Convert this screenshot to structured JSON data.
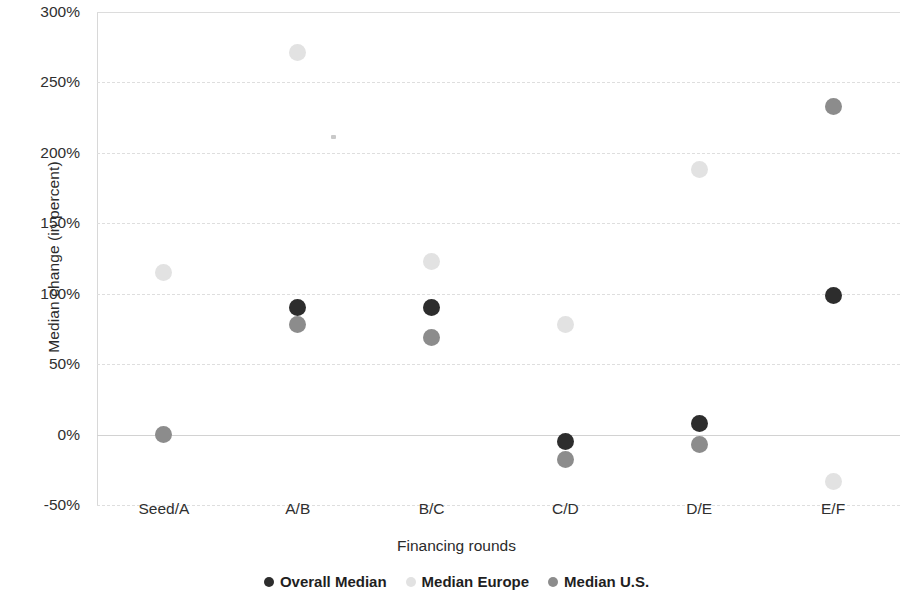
{
  "chart_data": {
    "type": "scatter",
    "title": "",
    "xlabel": "Financing rounds",
    "ylabel": "Median change (in percent)",
    "categories": [
      "Seed/A",
      "A/B",
      "B/C",
      "C/D",
      "D/E",
      "E/F"
    ],
    "yticks": [
      "-50%",
      "0%",
      "50%",
      "100%",
      "150%",
      "200%",
      "250%",
      "300%"
    ],
    "ytick_values": [
      -50,
      0,
      50,
      100,
      150,
      200,
      250,
      300
    ],
    "ylim": [
      -50,
      300
    ],
    "grid": true,
    "legend_position": "bottom",
    "series": [
      {
        "name": "Overall Median",
        "color": "#2d2d2d",
        "values": [
          null,
          90,
          90,
          -5,
          8,
          99
        ]
      },
      {
        "name": "Median Europe",
        "color": "#e2e2e2",
        "values": [
          115,
          271,
          123,
          78,
          188,
          -33
        ]
      },
      {
        "name": "Median U.S.",
        "color": "#8c8c8c",
        "values": [
          0,
          78,
          69,
          -18,
          -7,
          233
        ]
      }
    ]
  }
}
